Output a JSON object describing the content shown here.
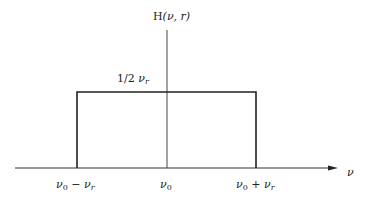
{
  "diagram": {
    "title": "H(ν, r)",
    "title_parts": {
      "func": "H",
      "args": "(ν, r)"
    },
    "x_axis_label": "ν",
    "level_label": "1/2 ν_r",
    "level_label_parts": {
      "frac": "1/2 ",
      "sym": "ν",
      "sub": "r"
    },
    "ticks": [
      {
        "sym": "ν",
        "sub0": "0",
        "op": " − ",
        "sym2": "ν",
        "sub2": "r",
        "text": "ν0 − νr"
      },
      {
        "sym": "ν",
        "sub0": "0",
        "text": "ν0"
      },
      {
        "sym": "ν",
        "sub0": "0",
        "op": " + ",
        "sym2": "ν",
        "sub2": "r",
        "text": "ν0 + νr"
      }
    ],
    "colors": {
      "line": "#222222",
      "axis": "#555555",
      "background": "#ffffff"
    }
  }
}
